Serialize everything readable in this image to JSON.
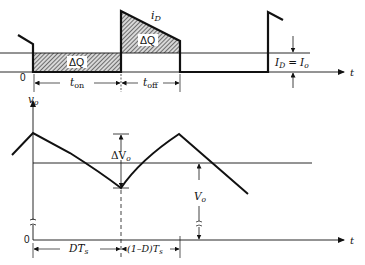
{
  "diagram": {
    "upper_plot": {
      "curve_label": "i",
      "curve_label_sub": "D",
      "area_label_on": "ΔQ",
      "area_label_off": "ΔQ",
      "origin_label": "0",
      "time_axis_label": "t",
      "level_label": "I",
      "level_label_sub1": "D",
      "level_label_eq": "=",
      "level_label_rhs": "I",
      "level_label_sub2": "o",
      "interval_on": "t",
      "interval_on_sub": "on",
      "interval_off": "t",
      "interval_off_sub": "off"
    },
    "lower_plot": {
      "y_axis_label": "v",
      "y_axis_label_sub": "o",
      "origin_label": "0",
      "time_axis_label": "t",
      "ripple_label": "ΔV",
      "ripple_label_sub": "o",
      "avg_label": "V",
      "avg_label_sub": "o",
      "interval_1": "DT",
      "interval_1_sub": "s",
      "interval_2_prefix": "(1–D)T",
      "interval_2_sub": "s"
    },
    "colors": {
      "line": "#111111",
      "hatch": "#555555",
      "label_bg": "#ffffff"
    }
  }
}
